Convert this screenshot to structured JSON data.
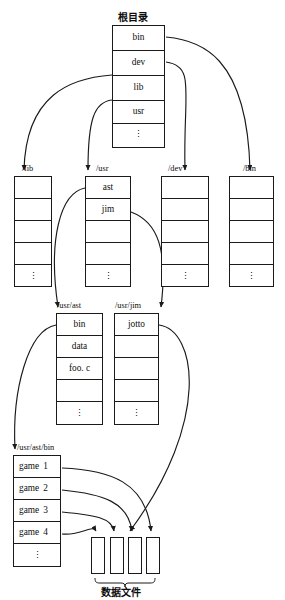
{
  "diagram": {
    "title_root": "根目录",
    "caption_datafiles": "数据文件",
    "nodes": {
      "root": {
        "label": "根目录",
        "entries": [
          "bin",
          "dev",
          "lib",
          "usr",
          "⋮"
        ]
      },
      "lib": {
        "label": "/lib",
        "entries": [
          "",
          "",
          "",
          "",
          "⋮"
        ]
      },
      "usr": {
        "label": "/usr",
        "entries": [
          "ast",
          "jim",
          "",
          "",
          "⋮"
        ]
      },
      "dev": {
        "label": "/dev",
        "entries": [
          "",
          "",
          "",
          "",
          "⋮"
        ]
      },
      "bin": {
        "label": "/bin",
        "entries": [
          "",
          "",
          "",
          "",
          "⋮"
        ]
      },
      "usr_ast": {
        "label": "/usr/ast",
        "entries": [
          "bin",
          "data",
          "foo. c",
          "",
          "⋮"
        ]
      },
      "usr_jim": {
        "label": "/usr/jim",
        "entries": [
          "jotto",
          "",
          "",
          "",
          "⋮"
        ]
      },
      "usr_ast_bin": {
        "label": "/usr/ast/bin",
        "entries": [
          "game",
          "game",
          "game",
          "game",
          "⋮"
        ],
        "numbers": [
          "1",
          "2",
          "3",
          "4",
          ""
        ]
      },
      "datafiles": {
        "label": "数据文件",
        "count": 4
      }
    },
    "edges": [
      {
        "from": "root.bin",
        "to": "/bin"
      },
      {
        "from": "root.dev",
        "to": "/dev"
      },
      {
        "from": "root.lib",
        "to": "/lib"
      },
      {
        "from": "root.usr",
        "to": "/usr"
      },
      {
        "from": "usr.ast",
        "to": "/usr/ast"
      },
      {
        "from": "usr.jim",
        "to": "/usr/jim"
      },
      {
        "from": "usr_ast.bin",
        "to": "/usr/ast/bin"
      },
      {
        "from": "usr_jim.jotto",
        "to": "datafile-3"
      },
      {
        "from": "usr_ast_bin.game1",
        "to": "datafile-4"
      },
      {
        "from": "usr_ast_bin.game2",
        "to": "datafile-3"
      },
      {
        "from": "usr_ast_bin.game3",
        "to": "datafile-2"
      },
      {
        "from": "usr_ast_bin.game4",
        "to": "datafile-1"
      }
    ],
    "colors": {
      "stroke": "#1a1a1a",
      "background": "#ffffff",
      "text": "#0d0d0d"
    }
  }
}
